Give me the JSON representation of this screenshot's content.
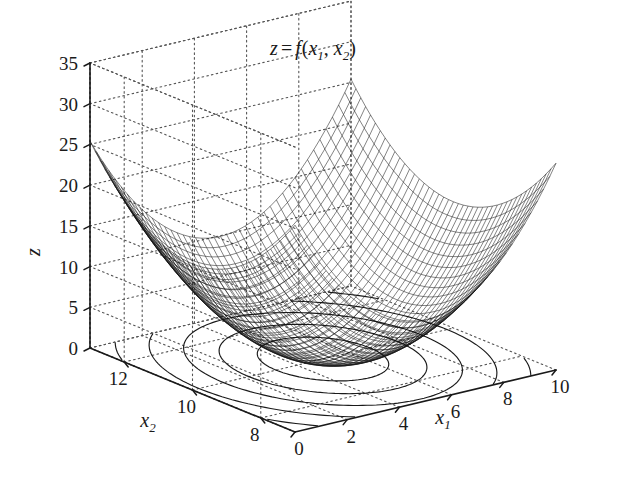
{
  "chart_data": {
    "type": "surface",
    "title_parts": {
      "z": "z",
      "eq": "=",
      "f": "f",
      "paren_open": "(",
      "x": "x",
      "sub1": "1",
      "comma": ", ",
      "sub2": "2",
      "paren_close": ")"
    },
    "surface_function": "paraboloid (convex bowl)",
    "axes": {
      "x1": {
        "label": "x1",
        "label_base": "x",
        "label_sub": "1",
        "ticks": [
          0,
          2,
          4,
          6,
          8,
          10
        ],
        "tick_labels": [
          "0",
          "2",
          "4",
          "6",
          "8",
          "10"
        ],
        "range": [
          0,
          10
        ]
      },
      "x2": {
        "label": "x2",
        "label_base": "x",
        "label_sub": "2",
        "ticks": [
          12,
          10,
          8
        ],
        "tick_labels": [
          "12",
          "10",
          "8"
        ],
        "range": [
          7,
          13
        ]
      },
      "z": {
        "label": "z",
        "ticks": [
          0,
          5,
          10,
          15,
          20,
          25,
          30,
          35
        ],
        "tick_labels": [
          "0",
          "5",
          "10",
          "15",
          "20",
          "25",
          "30",
          "35"
        ],
        "range": [
          0,
          35
        ]
      }
    },
    "grid": true,
    "grid_style": "dotted",
    "legend": null,
    "mesh": {
      "style": "wireframe",
      "color": "#111111",
      "rows": 40,
      "cols": 40
    },
    "contours": {
      "plane": "z=0 base",
      "levels": [
        2,
        5,
        9,
        14,
        20,
        27,
        34
      ],
      "count": 7,
      "color": "#1a1a1a"
    },
    "colors": {
      "background": "#ffffff",
      "axis": "#1a1a1a",
      "grid": "#555555",
      "mesh": "#111111"
    }
  }
}
